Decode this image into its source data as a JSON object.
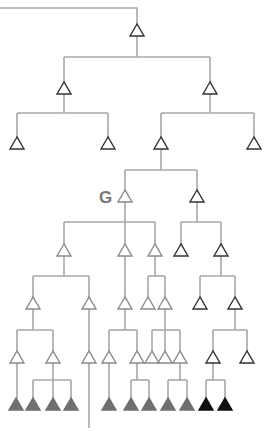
{
  "diagram": {
    "type": "phylogenetic-tree",
    "label": "G",
    "label_node": "n7",
    "colors": {
      "edge": "#a8a8a8",
      "open_stroke_light": "#8a8a8a",
      "open_stroke_dark": "#333333",
      "filled_gray": "#6f6f6f",
      "filled_black": "#111111"
    },
    "root_line": [
      [
        0,
        8
      ],
      [
        137,
        8
      ],
      [
        137,
        24
      ]
    ],
    "nodes": [
      {
        "id": "n1",
        "x": 137,
        "y": 30,
        "style": "open-dark"
      },
      {
        "id": "n2",
        "x": 64,
        "y": 88,
        "style": "open-dark"
      },
      {
        "id": "n3",
        "x": 210,
        "y": 88,
        "style": "open-dark"
      },
      {
        "id": "n4",
        "x": 17,
        "y": 143,
        "style": "open-dark"
      },
      {
        "id": "n5",
        "x": 108,
        "y": 143,
        "style": "open-dark"
      },
      {
        "id": "n6",
        "x": 161,
        "y": 143,
        "style": "open-dark"
      },
      {
        "id": "n6b",
        "x": 254,
        "y": 143,
        "style": "open-dark"
      },
      {
        "id": "n7",
        "x": 125,
        "y": 196,
        "style": "open-light"
      },
      {
        "id": "n8",
        "x": 197,
        "y": 196,
        "style": "open-dark"
      },
      {
        "id": "n9",
        "x": 64,
        "y": 250,
        "style": "open-light"
      },
      {
        "id": "n10",
        "x": 125,
        "y": 250,
        "style": "open-light"
      },
      {
        "id": "n11",
        "x": 155,
        "y": 250,
        "style": "open-light"
      },
      {
        "id": "n12",
        "x": 181,
        "y": 250,
        "style": "open-dark"
      },
      {
        "id": "n13",
        "x": 221,
        "y": 250,
        "style": "open-dark"
      },
      {
        "id": "n14",
        "x": 33,
        "y": 303,
        "style": "open-light"
      },
      {
        "id": "n15",
        "x": 89,
        "y": 303,
        "style": "open-light"
      },
      {
        "id": "n16",
        "x": 125,
        "y": 303,
        "style": "open-light"
      },
      {
        "id": "n17",
        "x": 148,
        "y": 303,
        "style": "open-light"
      },
      {
        "id": "n18",
        "x": 165,
        "y": 303,
        "style": "open-light"
      },
      {
        "id": "n19",
        "x": 200,
        "y": 303,
        "style": "open-dark"
      },
      {
        "id": "n20",
        "x": 235,
        "y": 303,
        "style": "open-dark"
      },
      {
        "id": "n21",
        "x": 17,
        "y": 357,
        "style": "open-light"
      },
      {
        "id": "n22",
        "x": 53,
        "y": 357,
        "style": "open-light"
      },
      {
        "id": "n23",
        "x": 89,
        "y": 357,
        "style": "open-light"
      },
      {
        "id": "n24",
        "x": 109,
        "y": 357,
        "style": "open-light"
      },
      {
        "id": "n25",
        "x": 137,
        "y": 357,
        "style": "open-light"
      },
      {
        "id": "n26",
        "x": 152,
        "y": 357,
        "style": "open-light"
      },
      {
        "id": "n27",
        "x": 165,
        "y": 357,
        "style": "open-light"
      },
      {
        "id": "n28",
        "x": 180,
        "y": 357,
        "style": "open-light"
      },
      {
        "id": "n29",
        "x": 213,
        "y": 357,
        "style": "open-dark"
      },
      {
        "id": "n30",
        "x": 247,
        "y": 357,
        "style": "open-dark"
      },
      {
        "id": "l1",
        "x": 16,
        "y": 404,
        "style": "filled-gray"
      },
      {
        "id": "l2",
        "x": 33,
        "y": 404,
        "style": "filled-gray"
      },
      {
        "id": "l3",
        "x": 53,
        "y": 404,
        "style": "filled-gray"
      },
      {
        "id": "l4",
        "x": 71,
        "y": 404,
        "style": "filled-gray"
      },
      {
        "id": "l5",
        "x": 109,
        "y": 404,
        "style": "filled-gray"
      },
      {
        "id": "l6",
        "x": 131,
        "y": 404,
        "style": "filled-gray"
      },
      {
        "id": "l7",
        "x": 149,
        "y": 404,
        "style": "filled-gray"
      },
      {
        "id": "l8",
        "x": 168,
        "y": 404,
        "style": "filled-gray"
      },
      {
        "id": "l9",
        "x": 187,
        "y": 404,
        "style": "filled-gray"
      },
      {
        "id": "l10",
        "x": 206,
        "y": 404,
        "style": "filled-black"
      },
      {
        "id": "l11",
        "x": 225,
        "y": 404,
        "style": "filled-black"
      }
    ],
    "edges": [
      [
        [
          137,
          36
        ],
        [
          137,
          57
        ]
      ],
      [
        [
          64,
          57
        ],
        [
          210,
          57
        ]
      ],
      [
        [
          64,
          57
        ],
        [
          64,
          82
        ]
      ],
      [
        [
          210,
          57
        ],
        [
          210,
          82
        ]
      ],
      [
        [
          64,
          94
        ],
        [
          64,
          113
        ]
      ],
      [
        [
          17,
          113
        ],
        [
          108,
          113
        ]
      ],
      [
        [
          17,
          113
        ],
        [
          17,
          137
        ]
      ],
      [
        [
          108,
          113
        ],
        [
          108,
          137
        ]
      ],
      [
        [
          210,
          94
        ],
        [
          210,
          113
        ]
      ],
      [
        [
          161,
          113
        ],
        [
          254,
          113
        ]
      ],
      [
        [
          161,
          113
        ],
        [
          161,
          137
        ]
      ],
      [
        [
          254,
          113
        ],
        [
          254,
          137
        ]
      ],
      [
        [
          161,
          149
        ],
        [
          161,
          170
        ]
      ],
      [
        [
          125,
          170
        ],
        [
          197,
          170
        ]
      ],
      [
        [
          125,
          170
        ],
        [
          125,
          190
        ]
      ],
      [
        [
          197,
          170
        ],
        [
          197,
          190
        ]
      ],
      [
        [
          125,
          202
        ],
        [
          125,
          244
        ]
      ],
      [
        [
          64,
          222
        ],
        [
          155,
          222
        ]
      ],
      [
        [
          64,
          222
        ],
        [
          64,
          244
        ]
      ],
      [
        [
          155,
          222
        ],
        [
          155,
          244
        ]
      ],
      [
        [
          197,
          202
        ],
        [
          197,
          222
        ]
      ],
      [
        [
          181,
          222
        ],
        [
          221,
          222
        ]
      ],
      [
        [
          181,
          222
        ],
        [
          181,
          244
        ]
      ],
      [
        [
          221,
          222
        ],
        [
          221,
          244
        ]
      ],
      [
        [
          64,
          256
        ],
        [
          64,
          276
        ]
      ],
      [
        [
          33,
          276
        ],
        [
          89,
          276
        ]
      ],
      [
        [
          33,
          276
        ],
        [
          33,
          297
        ]
      ],
      [
        [
          89,
          276
        ],
        [
          89,
          297
        ]
      ],
      [
        [
          125,
          256
        ],
        [
          125,
          297
        ]
      ],
      [
        [
          155,
          256
        ],
        [
          155,
          276
        ]
      ],
      [
        [
          148,
          276
        ],
        [
          165,
          276
        ]
      ],
      [
        [
          148,
          276
        ],
        [
          148,
          297
        ]
      ],
      [
        [
          165,
          276
        ],
        [
          165,
          297
        ]
      ],
      [
        [
          221,
          256
        ],
        [
          221,
          276
        ]
      ],
      [
        [
          200,
          276
        ],
        [
          235,
          276
        ]
      ],
      [
        [
          200,
          276
        ],
        [
          200,
          297
        ]
      ],
      [
        [
          235,
          276
        ],
        [
          235,
          297
        ]
      ],
      [
        [
          33,
          309
        ],
        [
          33,
          330
        ]
      ],
      [
        [
          17,
          330
        ],
        [
          53,
          330
        ]
      ],
      [
        [
          17,
          330
        ],
        [
          17,
          351
        ]
      ],
      [
        [
          53,
          330
        ],
        [
          53,
          351
        ]
      ],
      [
        [
          89,
          309
        ],
        [
          89,
          351
        ]
      ],
      [
        [
          125,
          309
        ],
        [
          125,
          330
        ]
      ],
      [
        [
          109,
          330
        ],
        [
          137,
          330
        ]
      ],
      [
        [
          109,
          330
        ],
        [
          109,
          351
        ]
      ],
      [
        [
          137,
          330
        ],
        [
          137,
          351
        ]
      ],
      [
        [
          165,
          309
        ],
        [
          165,
          351
        ]
      ],
      [
        [
          152,
          330
        ],
        [
          180,
          330
        ]
      ],
      [
        [
          152,
          330
        ],
        [
          152,
          351
        ]
      ],
      [
        [
          180,
          330
        ],
        [
          180,
          351
        ]
      ],
      [
        [
          235,
          309
        ],
        [
          235,
          330
        ]
      ],
      [
        [
          213,
          330
        ],
        [
          247,
          330
        ]
      ],
      [
        [
          213,
          330
        ],
        [
          213,
          351
        ]
      ],
      [
        [
          247,
          330
        ],
        [
          247,
          351
        ]
      ],
      [
        [
          17,
          363
        ],
        [
          17,
          398
        ]
      ],
      [
        [
          53,
          363
        ],
        [
          53,
          380
        ]
      ],
      [
        [
          33,
          380
        ],
        [
          71,
          380
        ]
      ],
      [
        [
          33,
          380
        ],
        [
          33,
          398
        ]
      ],
      [
        [
          53,
          380
        ],
        [
          53,
          398
        ]
      ],
      [
        [
          71,
          380
        ],
        [
          71,
          398
        ]
      ],
      [
        [
          89,
          363
        ],
        [
          89,
          428
        ]
      ],
      [
        [
          109,
          363
        ],
        [
          109,
          398
        ]
      ],
      [
        [
          137,
          363
        ],
        [
          137,
          380
        ]
      ],
      [
        [
          131,
          380
        ],
        [
          149,
          380
        ]
      ],
      [
        [
          131,
          380
        ],
        [
          131,
          398
        ]
      ],
      [
        [
          149,
          380
        ],
        [
          149,
          398
        ]
      ],
      [
        [
          180,
          363
        ],
        [
          180,
          380
        ]
      ],
      [
        [
          168,
          380
        ],
        [
          187,
          380
        ]
      ],
      [
        [
          168,
          380
        ],
        [
          168,
          398
        ]
      ],
      [
        [
          187,
          380
        ],
        [
          187,
          398
        ]
      ],
      [
        [
          213,
          363
        ],
        [
          213,
          380
        ]
      ],
      [
        [
          206,
          380
        ],
        [
          225,
          380
        ]
      ],
      [
        [
          206,
          380
        ],
        [
          206,
          398
        ]
      ],
      [
        [
          225,
          380
        ],
        [
          225,
          398
        ]
      ]
    ]
  }
}
